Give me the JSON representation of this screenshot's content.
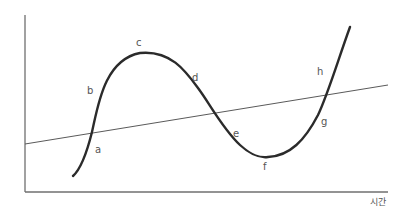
{
  "diagram": {
    "type": "cycle-curve-with-trend-line",
    "x_axis_label": "시간",
    "y_axis_label": "",
    "colors": {
      "axis": "#6f6f6f",
      "trend_line": "#5a5a5a",
      "curve": "#2b2b2b",
      "labels": "#555555"
    },
    "points": [
      {
        "id": "a",
        "label": "a",
        "description": "curve crosses trend line upward"
      },
      {
        "id": "b",
        "label": "b",
        "description": "rising phase"
      },
      {
        "id": "c",
        "label": "c",
        "description": "peak"
      },
      {
        "id": "d",
        "label": "d",
        "description": "falling phase"
      },
      {
        "id": "e",
        "label": "e",
        "description": "below trend, falling"
      },
      {
        "id": "f",
        "label": "f",
        "description": "trough"
      },
      {
        "id": "g",
        "label": "g",
        "description": "recovery"
      },
      {
        "id": "h",
        "label": "h",
        "description": "above trend, rising"
      }
    ]
  },
  "labels": {
    "a": "a",
    "b": "b",
    "c": "c",
    "d": "d",
    "e": "e",
    "f": "f",
    "g": "g",
    "h": "h",
    "time": "시간"
  }
}
